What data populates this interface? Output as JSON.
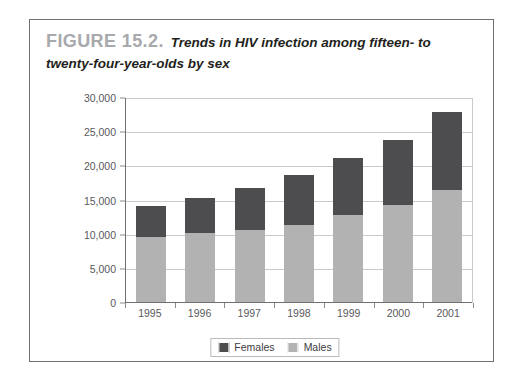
{
  "figure": {
    "number": "FIGURE 15.2.",
    "title": "Trends in HIV infection among fifteen- to twenty-four-year-olds by sex"
  },
  "colors": {
    "females": "#4d4d4f",
    "males": "#b2b2b2",
    "frame": "#6f7072",
    "gridline": "#c9cacc",
    "figure_number": "#a7a9ac",
    "axis_text": "#58595b"
  },
  "chart_data": {
    "type": "bar",
    "stacked": true,
    "title": "Trends in HIV infection among fifteen- to twenty-four-year-olds by sex",
    "xlabel": "",
    "ylabel": "",
    "categories": [
      "1995",
      "1996",
      "1997",
      "1998",
      "1999",
      "2000",
      "2001"
    ],
    "series": [
      {
        "name": "Males",
        "color": "#b2b2b2",
        "values": [
          9700,
          10200,
          10700,
          11400,
          12900,
          14300,
          16600
        ]
      },
      {
        "name": "Females",
        "color": "#4d4d4f",
        "values": [
          4500,
          5200,
          6100,
          7300,
          8300,
          9500,
          11300
        ]
      }
    ],
    "totals": [
      14200,
      15400,
      16800,
      18700,
      21200,
      23800,
      27900
    ],
    "ylim": [
      0,
      30000
    ],
    "ytick_values": [
      0,
      5000,
      10000,
      15000,
      20000,
      25000,
      30000
    ],
    "ytick_labels": [
      "0",
      "5,000",
      "10,000",
      "15,000",
      "20,000",
      "25,000",
      "30,000"
    ],
    "grid": true,
    "legend_position": "bottom",
    "legend_entries": [
      "Females",
      "Males"
    ]
  }
}
